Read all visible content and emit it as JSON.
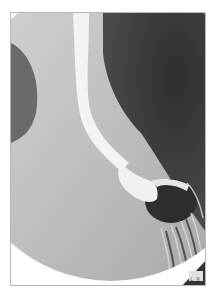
{
  "image": {
    "description": "Barium swallow radiograph showing contrast-filled esophagus descending into stomach",
    "corner_marker": "L R"
  },
  "colors": {
    "background": "#ffffff",
    "frame_border": "#b8b8b8",
    "contrast": "#f2f2f2",
    "dark_lung": "#3a3a3a",
    "soft_tissue": "#bdbdbd"
  }
}
